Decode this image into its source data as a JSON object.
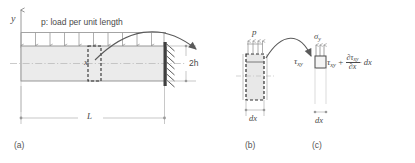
{
  "figure": {
    "colors": {
      "beam_fill": "#ebebeb",
      "element_fill": "#e4e4e4",
      "line": "#6e6e6e",
      "dashed": "#2e2e2e",
      "wall": "#4a4a4a",
      "text": "#4a4a4a",
      "dim": "#9a9a9a",
      "arrow": "#5a5a5a"
    }
  },
  "panel_a": {
    "caption": "(a)",
    "axis_y_label": "y",
    "load_label": "p: load per unit length",
    "position_label": "x",
    "depth_label": "2h",
    "length_label": "L",
    "load_arrow_count": 11,
    "support_hatch_count": 7
  },
  "panel_b": {
    "caption": "(b)",
    "load_label": "p",
    "width_label": "dx",
    "load_arrow_count": 4
  },
  "panel_c": {
    "caption": "(c)",
    "sigma_y_label": "σ",
    "sigma_y_sub": "y",
    "tau_left_label": "τ",
    "tau_left_sub": "xy",
    "tau_right_label": "τ",
    "tau_right_sub": "xy",
    "plus_sign": "+",
    "partial_num_symbol": "∂τ",
    "partial_num_sub": "xy",
    "partial_den_symbol": "∂x",
    "dot_dx": "· dx",
    "width_label": "dx",
    "sigma_arrow_count": 3
  }
}
